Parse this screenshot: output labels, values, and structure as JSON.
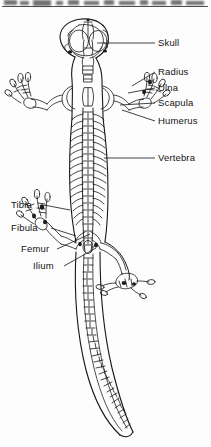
{
  "figure": {
    "view": "dorsal",
    "ink_color": "#131313",
    "paper_color": "#fdfdfd"
  },
  "labels": {
    "right": [
      {
        "text": "Skull",
        "name": "label-skull",
        "x": 158,
        "y": 38,
        "leader_from_x": 142,
        "leader_from_y": 43,
        "leader_to_x": 95,
        "leader_to_y": 43
      },
      {
        "text": "Radius",
        "name": "label-radius",
        "x": 158,
        "y": 70,
        "leader_from_x": 155,
        "leader_from_y": 75,
        "leader_to_x": 128,
        "leader_to_y": 86
      },
      {
        "text": "Ulna",
        "name": "label-ulna",
        "x": 158,
        "y": 85,
        "leader_from_x": 148,
        "leader_from_y": 90,
        "leader_to_x": 127,
        "leader_to_y": 92
      },
      {
        "text": "Scapula",
        "name": "label-scapula",
        "x": 158,
        "y": 100,
        "leader_from_x": 140,
        "leader_from_y": 105,
        "leader_to_x": 121,
        "leader_to_y": 105
      },
      {
        "text": "Humerus",
        "name": "label-humerus",
        "x": 158,
        "y": 120,
        "leader_from_x": 155,
        "leader_from_y": 124,
        "leader_to_x": 122,
        "leader_to_y": 112
      },
      {
        "text": "Vertebra",
        "name": "label-vertebra",
        "x": 158,
        "y": 155,
        "leader_from_x": 142,
        "leader_from_y": 160,
        "leader_to_x": 106,
        "leader_to_y": 160
      }
    ],
    "left": [
      {
        "text": "Tibia",
        "name": "label-tibia",
        "x": 11,
        "y": 200,
        "leader_from_x": 45,
        "leader_from_y": 205,
        "leader_to_x": 66,
        "leader_to_y": 208
      },
      {
        "text": "Fibula",
        "name": "label-fibula",
        "x": 11,
        "y": 223,
        "leader_from_x": 50,
        "leader_from_y": 228,
        "leader_to_x": 72,
        "leader_to_y": 232
      },
      {
        "text": "Femur",
        "name": "label-femur",
        "x": 21,
        "y": 245,
        "leader_from_x": 58,
        "leader_from_y": 249,
        "leader_to_x": 86,
        "leader_to_y": 236
      },
      {
        "text": "Ilium",
        "name": "label-ilium",
        "x": 33,
        "y": 262,
        "leader_from_x": 65,
        "leader_from_y": 266,
        "leader_to_x": 93,
        "leader_to_y": 250
      }
    ]
  },
  "anatomy_parts": [
    "skull",
    "orbit-left",
    "orbit-right",
    "mandible",
    "cervical-vertebrae",
    "vertebral-column",
    "ribs",
    "scapula",
    "humerus",
    "radius",
    "ulna",
    "carpals",
    "forelimb-digits",
    "ilium",
    "femur",
    "tibia",
    "fibula",
    "tarsals",
    "hindlimb-digits",
    "caudal-vertebrae",
    "tail"
  ]
}
